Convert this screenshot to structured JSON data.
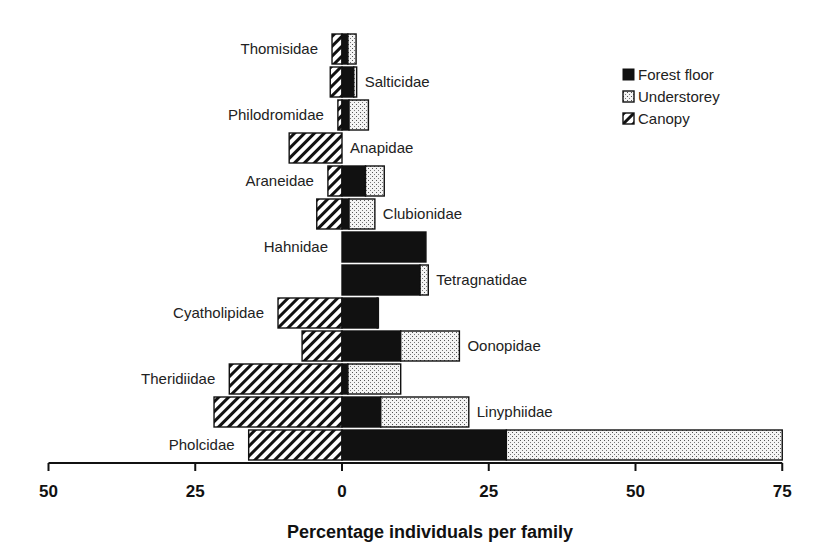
{
  "chart_data": {
    "type": "bar",
    "orientation": "horizontal",
    "stacked": true,
    "diverging": true,
    "title": "",
    "xlabel": "Percentage individuals per family",
    "ylabel": "",
    "xlim": [
      -50,
      75
    ],
    "xticks": [
      -50,
      -25,
      0,
      25,
      50,
      75
    ],
    "xtick_labels": [
      "50",
      "25",
      "0",
      "25",
      "50",
      "75"
    ],
    "grid": false,
    "legend_position": "top-right",
    "categories": [
      "Thomisidae",
      "Salticidae",
      "Philodromidae",
      "Anapidae",
      "Araneidae",
      "Clubionidae",
      "Hahnidae",
      "Tetragnatidae",
      "Cyatholipidae",
      "Oonopidae",
      "Theridiidae",
      "Linyphiidae",
      "Pholcidae"
    ],
    "label_side": [
      "left",
      "right",
      "left",
      "right",
      "left",
      "right",
      "left",
      "right",
      "left",
      "right",
      "left",
      "right",
      "left"
    ],
    "series": [
      {
        "name": "Forest floor",
        "direction": "right",
        "pattern": "solid-black",
        "values": [
          1.0,
          2.0,
          1.2,
          0,
          4.0,
          1.2,
          14.3,
          13.3,
          6.0,
          10.0,
          1.0,
          6.6,
          28.0
        ]
      },
      {
        "name": "Understorey",
        "direction": "right",
        "pattern": "stipple",
        "values": [
          1.4,
          0.5,
          3.3,
          0,
          3.2,
          4.4,
          0,
          1.4,
          0.2,
          10.0,
          9.0,
          15.0,
          47.0
        ]
      },
      {
        "name": "Canopy",
        "direction": "left",
        "pattern": "diagonal-hatch",
        "values": [
          1.7,
          2.0,
          0.7,
          9.0,
          2.4,
          4.3,
          0,
          0,
          10.9,
          6.8,
          19.2,
          21.8,
          15.9
        ]
      }
    ]
  },
  "legend": {
    "items": [
      {
        "label": "Forest floor",
        "pattern": "solid"
      },
      {
        "label": "Understorey",
        "pattern": "stipple"
      },
      {
        "label": "Canopy",
        "pattern": "hatch"
      }
    ]
  },
  "colors": {
    "ink": "#111111",
    "stipple_bg": "#f2f2f2",
    "background": "#ffffff"
  }
}
